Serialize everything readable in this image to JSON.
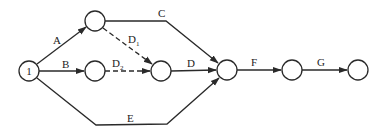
{
  "diagram": {
    "type": "activity-on-arrow network",
    "colors": {
      "line": "#2a2a2a",
      "background": "#ffffff"
    },
    "nodes": [
      {
        "id": "n1",
        "label": "1",
        "cx": 29,
        "cy": 71
      },
      {
        "id": "n2",
        "label": "",
        "cx": 95,
        "cy": 21
      },
      {
        "id": "n3",
        "label": "",
        "cx": 95,
        "cy": 71
      },
      {
        "id": "n4",
        "label": "",
        "cx": 161,
        "cy": 71
      },
      {
        "id": "n5",
        "label": "",
        "cx": 227,
        "cy": 70
      },
      {
        "id": "n6",
        "label": "",
        "cx": 292,
        "cy": 70
      },
      {
        "id": "n7",
        "label": "",
        "cx": 358,
        "cy": 70
      }
    ],
    "activities": [
      {
        "label": "A",
        "from": "n1",
        "to": "n2",
        "style": "solid"
      },
      {
        "label": "B",
        "from": "n1",
        "to": "n3",
        "style": "solid"
      },
      {
        "label": "C",
        "from": "n2",
        "to": "n5",
        "style": "solid"
      },
      {
        "label": "D",
        "sub": "1",
        "from": "n2",
        "to": "n4",
        "style": "dashed"
      },
      {
        "label": "D",
        "sub": "2",
        "from": "n3",
        "to": "n4",
        "style": "dashed"
      },
      {
        "label": "D",
        "from": "n4",
        "to": "n5",
        "style": "solid"
      },
      {
        "label": "E",
        "from": "n1",
        "to": "n5",
        "style": "solid"
      },
      {
        "label": "F",
        "from": "n5",
        "to": "n6",
        "style": "solid"
      },
      {
        "label": "G",
        "from": "n6",
        "to": "n7",
        "style": "solid"
      }
    ]
  }
}
